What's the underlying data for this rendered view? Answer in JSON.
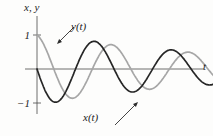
{
  "figure": {
    "background": "#fdfdfc",
    "axis_color": "#4a4a4a",
    "arrow_color": "#2e2e2e",
    "text_color": "#1c1c1c"
  },
  "labels": {
    "y_axis_title": "x, y",
    "t_axis_label": "t",
    "tick_top": "1",
    "tick_bottom": "−1",
    "curve_y_label": "y(t)",
    "curve_x_label": "x(t)"
  },
  "chart_data": {
    "type": "line",
    "title": "",
    "xlabel": "t",
    "ylabel": "x, y",
    "x_range": [
      0,
      10.5
    ],
    "ylim": [
      -1.4,
      1.6
    ],
    "y_ticks": [
      1,
      -1
    ],
    "grid": false,
    "legend": "inline-arrow-annotations",
    "series": [
      {
        "name": "y(t)",
        "color": "#a6a6a6",
        "model": {
          "kind": "cos",
          "sign": 1,
          "A": 1.02,
          "decay": 0.08,
          "omega": 1.37,
          "phase": 0.2
        },
        "points": [
          [
            0,
            1.0
          ],
          [
            0.5,
            0.621
          ],
          [
            1,
            0.001
          ],
          [
            1.5,
            -0.573
          ],
          [
            2,
            -0.852
          ],
          [
            2.5,
            -0.74
          ],
          [
            3,
            -0.313
          ],
          [
            3.5,
            0.214
          ],
          [
            4,
            0.61
          ],
          [
            4.5,
            0.71
          ],
          [
            5,
            0.492
          ],
          [
            5.5,
            0.078
          ],
          [
            6,
            -0.338
          ],
          [
            6.5,
            -0.577
          ],
          [
            7,
            -0.544
          ],
          [
            7.5,
            -0.278
          ],
          [
            8,
            0.088
          ],
          [
            8.5,
            0.388
          ],
          [
            9,
            0.496
          ],
          [
            9.5,
            0.38
          ],
          [
            10,
            0.108
          ],
          [
            10.5,
            -0.191
          ]
        ]
      },
      {
        "name": "x(t)",
        "color": "#262626",
        "model": {
          "kind": "sin",
          "sign": -1,
          "A": 1.07,
          "decay": 0.08,
          "omega": 1.37,
          "phase": 0
        },
        "points": [
          [
            0,
            0.0
          ],
          [
            0.5,
            -0.644
          ],
          [
            1,
            -0.968
          ],
          [
            1.5,
            -0.839
          ],
          [
            2,
            -0.356
          ],
          [
            2.5,
            0.246
          ],
          [
            3,
            0.689
          ],
          [
            3.5,
            0.806
          ],
          [
            4,
            0.56
          ],
          [
            4.5,
            0.088
          ],
          [
            5,
            -0.385
          ],
          [
            5.5,
            -0.654
          ],
          [
            6,
            -0.619
          ],
          [
            6.5,
            -0.318
          ],
          [
            7,
            0.101
          ],
          [
            7.5,
            0.445
          ],
          [
            8,
            0.564
          ],
          [
            8.5,
            0.43
          ],
          [
            9,
            0.122
          ],
          [
            9.5,
            -0.217
          ],
          [
            10,
            -0.435
          ],
          [
            10.5,
            -0.448
          ]
        ]
      }
    ],
    "annotations": [
      {
        "text": "y(t)",
        "target_series": "y(t)"
      },
      {
        "text": "x(t)",
        "target_series": "x(t)"
      }
    ]
  }
}
